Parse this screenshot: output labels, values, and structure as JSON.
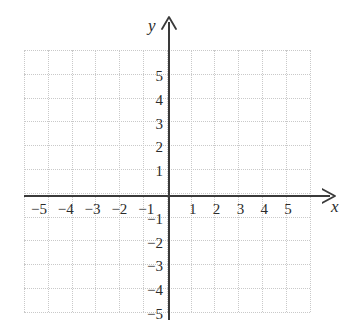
{
  "figure": {
    "background_color": "#ffffff",
    "axis_color": "#3a3a3a",
    "grid_color": "#c9c9c9",
    "label_color": "#2b2b2b"
  },
  "axes": {
    "x_label": "x",
    "y_label": "y",
    "x_arrow_direction": "right",
    "y_arrow_direction": "up"
  },
  "chart_data": {
    "type": "scatter",
    "title": "",
    "subtitle": "",
    "xlabel": "x",
    "ylabel": "y",
    "xlim": [
      -6,
      6
    ],
    "ylim": [
      -5.5,
      5.5
    ],
    "grid": true,
    "grid_spacing": 1,
    "legend": "none",
    "x_ticks": [
      -5,
      -4,
      -3,
      -2,
      -1,
      1,
      2,
      3,
      4,
      5
    ],
    "y_ticks": [
      -5,
      -4,
      -3,
      -2,
      -1,
      1,
      2,
      3,
      4,
      5
    ],
    "x_tick_labels": [
      "−5",
      "−4",
      "−3",
      "−2",
      "−1",
      "1",
      "2",
      "3",
      "4",
      "5"
    ],
    "y_tick_labels": [
      "−5",
      "−4",
      "−3",
      "−2",
      "−1",
      "1",
      "2",
      "3",
      "4",
      "5"
    ],
    "series": [],
    "annotations": [],
    "note": "Empty blank coordinate grid, no plotted data points or curves"
  },
  "ticks": {
    "x_positive": [
      {
        "value": 1,
        "label": "1"
      },
      {
        "value": 2,
        "label": "2"
      },
      {
        "value": 3,
        "label": "3"
      },
      {
        "value": 4,
        "label": "4"
      },
      {
        "value": 5,
        "label": "5"
      }
    ],
    "x_negative": [
      {
        "value": -5,
        "label": "−5"
      },
      {
        "value": -4,
        "label": "−4"
      },
      {
        "value": -3,
        "label": "−3"
      },
      {
        "value": -2,
        "label": "−2"
      },
      {
        "value": -1,
        "label": "−1"
      }
    ],
    "y_positive": [
      {
        "value": 5,
        "label": "5"
      },
      {
        "value": 4,
        "label": "4"
      },
      {
        "value": 3,
        "label": "3"
      },
      {
        "value": 2,
        "label": "2"
      },
      {
        "value": 1,
        "label": "1"
      }
    ],
    "y_negative": [
      {
        "value": -1,
        "label": "−1"
      },
      {
        "value": -2,
        "label": "−2"
      },
      {
        "value": -3,
        "label": "−3"
      },
      {
        "value": -4,
        "label": "−4"
      },
      {
        "value": -5,
        "label": "−5"
      }
    ]
  }
}
